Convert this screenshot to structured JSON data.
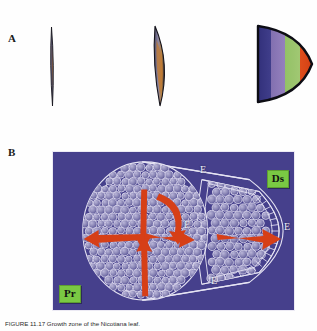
{
  "figure": {
    "panels": [
      {
        "id": "A",
        "label": "A"
      },
      {
        "id": "B",
        "label": "B"
      }
    ],
    "caption": "FIGURE 11.17 Growth zone of the Nicotiana leaf."
  },
  "panel_a": {
    "name": "leaf-primordium-stages",
    "shapes": [
      {
        "name": "stage-1-sliver",
        "description": "very narrow straight leaf primordium cross-section",
        "outline_color": "#1b1b22",
        "fill_color": "#6e6a86",
        "accent_color": "#9a5a2a"
      },
      {
        "name": "stage-2-crescent",
        "description": "curved crescent leaf primordium cross-section",
        "outline_color": "#1b1b22",
        "fill_color": "#6e6a86",
        "accent_color": "#c9813c"
      },
      {
        "name": "stage-3-banded-leaf",
        "description": "pointed oval leaf with four colored growth bands",
        "outline_color": "#111118",
        "bands": [
          {
            "name": "band-navy",
            "color": "#3b3a8c"
          },
          {
            "name": "band-purple",
            "color": "#8d77bd"
          },
          {
            "name": "band-green",
            "color": "#9cc86a"
          },
          {
            "name": "band-orange",
            "color": "#e4471c"
          }
        ]
      }
    ]
  },
  "panel_b": {
    "name": "three-dimensional-growth-diagram",
    "background_color": "#46408c",
    "cell_outline_color": "#dcd9ee",
    "cell_fill_color": "#8e8ab9",
    "arrow_color": "#d63f17",
    "tags": [
      {
        "id": "pr",
        "label": "Pr",
        "color": "#7ac943",
        "meaning": "proximal"
      },
      {
        "id": "ds",
        "label": "Ds",
        "color": "#7ac943",
        "meaning": "distal"
      }
    ],
    "epidermis_labels": [
      {
        "id": "e-top",
        "label": "E"
      },
      {
        "id": "e-mid",
        "label": "E"
      },
      {
        "id": "e-right",
        "label": "E"
      },
      {
        "id": "e-bot",
        "label": "E"
      }
    ],
    "arrows": [
      {
        "name": "arrow-down",
        "direction": "down",
        "section": "proximal"
      },
      {
        "name": "arrow-up",
        "direction": "up",
        "section": "proximal"
      },
      {
        "name": "arrow-left",
        "direction": "left",
        "section": "proximal"
      },
      {
        "name": "arrow-right",
        "direction": "right",
        "section": "proximal"
      },
      {
        "name": "arrow-curved",
        "direction": "curved-down",
        "section": "proximal"
      },
      {
        "name": "arrow-distal-right",
        "direction": "right",
        "section": "distal"
      }
    ]
  }
}
